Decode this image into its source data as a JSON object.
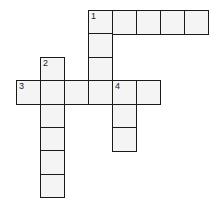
{
  "puzzle": {
    "type": "crossword",
    "cell_size_px": 24,
    "origin": {
      "x": 16,
      "y": 10
    },
    "row_height_px": 23.4,
    "clues": [
      {
        "number": "1",
        "direction": "across",
        "row": 0,
        "col": 3,
        "length": 5
      },
      {
        "number": "1",
        "direction": "down",
        "row": 0,
        "col": 3,
        "length": 4
      },
      {
        "number": "2",
        "direction": "down",
        "row": 2,
        "col": 1,
        "length": 6
      },
      {
        "number": "3",
        "direction": "across",
        "row": 3,
        "col": 0,
        "length": 6
      },
      {
        "number": "4",
        "direction": "down",
        "row": 3,
        "col": 4,
        "length": 3
      }
    ],
    "colors": {
      "border": "#1a1a1a",
      "cell_fill": "#f4f4f4",
      "background": "#ffffff"
    }
  }
}
